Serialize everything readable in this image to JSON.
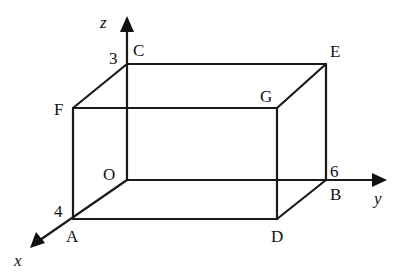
{
  "diagram": {
    "type": "3d-rectangular-box",
    "axes": {
      "x": {
        "label": "x",
        "extent_label": "4"
      },
      "y": {
        "label": "y",
        "extent_label": "6"
      },
      "z": {
        "label": "z",
        "extent_label": "3"
      }
    },
    "vertices": {
      "O": {
        "label": "O",
        "coords": [
          0,
          0,
          0
        ]
      },
      "A": {
        "label": "A",
        "coords": [
          4,
          0,
          0
        ]
      },
      "B": {
        "label": "B",
        "coords": [
          0,
          6,
          0
        ]
      },
      "C": {
        "label": "C",
        "coords": [
          0,
          0,
          3
        ]
      },
      "D": {
        "label": "D",
        "coords": [
          4,
          6,
          0
        ]
      },
      "E": {
        "label": "E",
        "coords": [
          0,
          6,
          3
        ]
      },
      "F": {
        "label": "F",
        "coords": [
          4,
          0,
          3
        ]
      },
      "G": {
        "label": "G",
        "coords": [
          4,
          6,
          3
        ]
      }
    },
    "line_color": "#1a1a1a"
  }
}
